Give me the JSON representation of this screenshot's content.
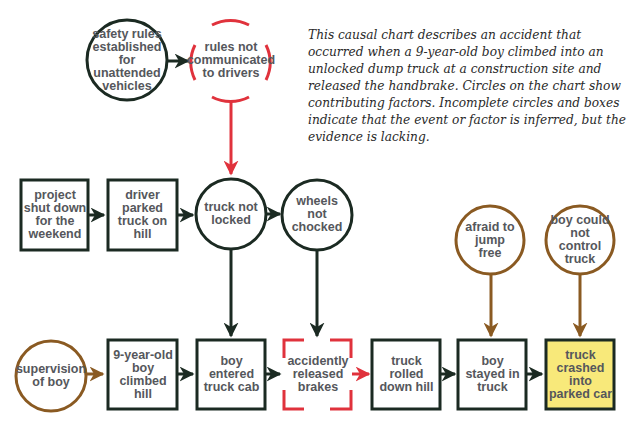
{
  "caption": "This causal chart describes an accident that occurred when a 9-year-old boy climbed into an unlocked dump truck at a construction site and released the handbrake. Circles on the chart show contributing factors. Incomplete circles and boxes indicate that the event or factor is inferred, but the evidence is lacking.",
  "colors": {
    "event_stroke": "#1b2a22",
    "inferred_stroke": "#e0323c",
    "factor_brown": "#8a5a22",
    "final_event_fill": "#f8e97a",
    "text": "#55575c"
  },
  "nodes": {
    "safety_rules": "safety rules established for unattended vehicles",
    "rules_not_communicated": "rules not communicated to drivers",
    "project_shut_down": "project shut down for the weekend",
    "driver_parked": "driver parked truck on hill",
    "truck_not_locked": "truck not locked",
    "wheels_not_chocked": "wheels not chocked",
    "afraid_to_jump": "afraid to jump free",
    "boy_could_not_control": "boy could not control truck",
    "supervision": "supervision of boy",
    "boy_climbed_hill": "9-year-old boy climbed hill",
    "boy_entered_cab": "boy entered truck cab",
    "released_brakes": "accidently released brakes",
    "truck_rolled": "truck rolled down hill",
    "boy_stayed": "boy stayed in truck",
    "truck_crashed": "truck crashed into parked car"
  }
}
